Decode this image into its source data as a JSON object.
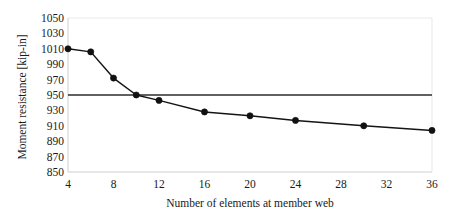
{
  "chart_data": {
    "type": "line",
    "title": "",
    "xlabel": "Number of elements at member web",
    "ylabel": "Moment resistance [kip-in]",
    "xlim": [
      4,
      36
    ],
    "ylim": [
      850,
      1050
    ],
    "xticks": [
      4,
      8,
      12,
      16,
      20,
      24,
      28,
      32,
      36
    ],
    "yticks": [
      850,
      870,
      890,
      910,
      930,
      950,
      970,
      990,
      1010,
      1030,
      1050
    ],
    "grid": false,
    "legend": "none",
    "series": [
      {
        "name": "Moment resistance",
        "marker": "filled-circle",
        "color": "#111111",
        "x": [
          4,
          6,
          8,
          10,
          12,
          16,
          20,
          24,
          30,
          36
        ],
        "y": [
          1010,
          1006,
          972,
          950,
          943,
          928,
          923,
          917,
          910,
          904
        ]
      },
      {
        "name": "Reference level",
        "marker": "none",
        "color": "#2b2b2b",
        "x": [
          4,
          36
        ],
        "y": [
          950,
          950
        ]
      }
    ],
    "annotations": []
  },
  "axes": {
    "y_tick_labels": [
      "1050",
      "1030",
      "1010",
      "990",
      "970",
      "950",
      "930",
      "910",
      "890",
      "870",
      "850"
    ],
    "x_tick_labels": [
      "4",
      "8",
      "12",
      "16",
      "20",
      "24",
      "28",
      "32",
      "36"
    ],
    "y_axis_title": "Moment resistance [kip-in]",
    "x_axis_title": "Number of elements at member web"
  },
  "colors": {
    "series": "#111111",
    "reference": "#2b2b2b",
    "frame": "#e9e9e9",
    "background": "#ffffff"
  }
}
